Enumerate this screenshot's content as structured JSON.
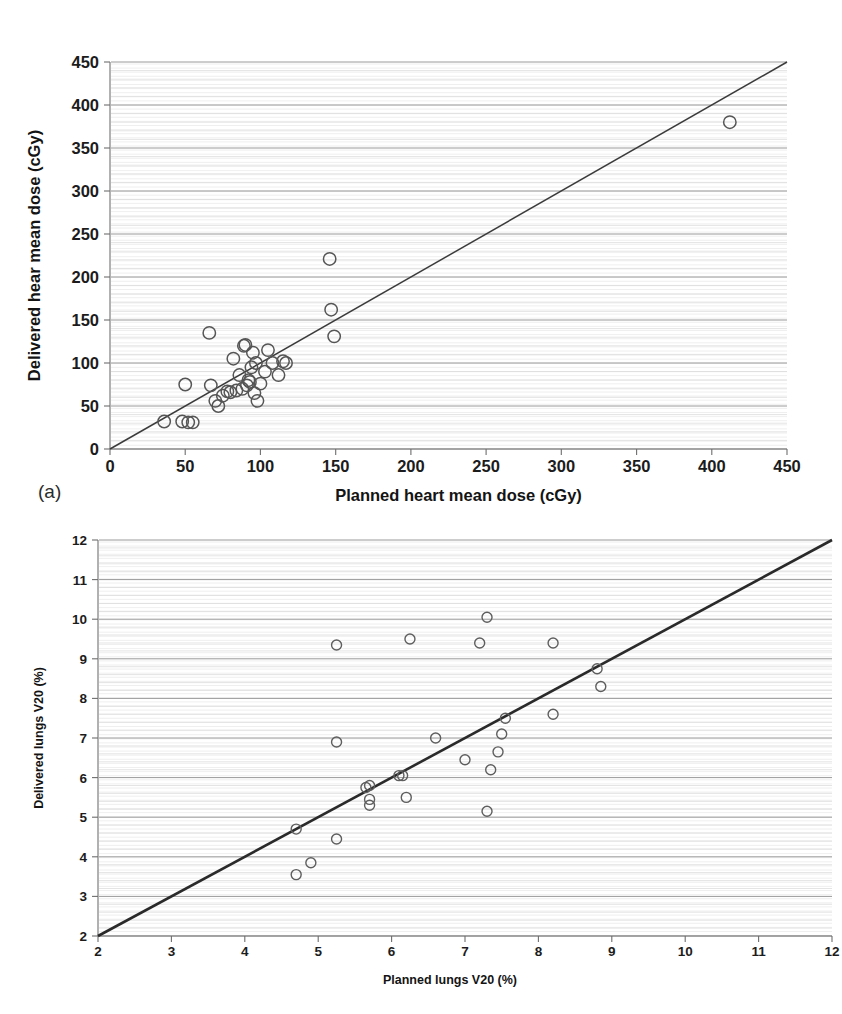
{
  "figure": {
    "panels": [
      {
        "id": "a",
        "label": "(a)"
      },
      {
        "id": "b",
        "label": "(b)"
      }
    ]
  },
  "chart_data": [
    {
      "type": "scatter",
      "panel": "(a)",
      "title": "",
      "xlabel": "Planned heart mean dose (cGy)",
      "ylabel": "Delivered hear mean dose (cGy)",
      "xlim": [
        0,
        450
      ],
      "ylim": [
        0,
        450
      ],
      "xticks": [
        0,
        50,
        100,
        150,
        200,
        250,
        300,
        350,
        400,
        450
      ],
      "yticks": [
        0,
        50,
        100,
        150,
        200,
        250,
        300,
        350,
        400,
        450
      ],
      "grid": true,
      "grid_axis": "y",
      "legend": "none",
      "marker": "open-circle",
      "reference_line": {
        "type": "identity",
        "from": [
          0,
          0
        ],
        "to": [
          450,
          450
        ],
        "label": "y = x"
      },
      "points": [
        [
          36,
          32
        ],
        [
          48,
          32
        ],
        [
          50,
          75
        ],
        [
          52,
          31
        ],
        [
          55,
          31
        ],
        [
          66,
          135
        ],
        [
          67,
          74
        ],
        [
          70,
          56
        ],
        [
          72,
          50
        ],
        [
          75,
          62
        ],
        [
          78,
          67
        ],
        [
          80,
          66
        ],
        [
          82,
          105
        ],
        [
          84,
          68
        ],
        [
          86,
          86
        ],
        [
          88,
          70
        ],
        [
          89,
          120
        ],
        [
          90,
          121
        ],
        [
          91,
          74
        ],
        [
          92,
          80
        ],
        [
          93,
          78
        ],
        [
          94,
          95
        ],
        [
          95,
          112
        ],
        [
          96,
          65
        ],
        [
          97,
          100
        ],
        [
          98,
          56
        ],
        [
          100,
          76
        ],
        [
          103,
          90
        ],
        [
          105,
          115
        ],
        [
          108,
          100
        ],
        [
          112,
          86
        ],
        [
          115,
          102
        ],
        [
          117,
          100
        ],
        [
          146,
          221
        ],
        [
          147,
          162
        ],
        [
          149,
          131
        ],
        [
          412,
          380
        ]
      ]
    },
    {
      "type": "scatter",
      "panel": "(b)",
      "title": "",
      "xlabel": "Planned lungs V20 (%)",
      "ylabel": "Delivered lungs V20 (%)",
      "xlim": [
        2,
        12
      ],
      "ylim": [
        2,
        12
      ],
      "xticks": [
        2,
        3,
        4,
        5,
        6,
        7,
        8,
        9,
        10,
        11,
        12
      ],
      "yticks": [
        2,
        3,
        4,
        5,
        6,
        7,
        8,
        9,
        10,
        11,
        12
      ],
      "grid": true,
      "grid_axis": "y",
      "legend": "none",
      "marker": "open-circle",
      "reference_line": {
        "type": "identity",
        "from": [
          2,
          2
        ],
        "to": [
          12,
          12
        ],
        "label": "y = x"
      },
      "points": [
        [
          4.7,
          3.55
        ],
        [
          4.9,
          3.85
        ],
        [
          4.7,
          4.7
        ],
        [
          5.25,
          4.45
        ],
        [
          5.25,
          6.9
        ],
        [
          5.25,
          9.35
        ],
        [
          5.65,
          5.75
        ],
        [
          5.7,
          5.8
        ],
        [
          5.7,
          5.45
        ],
        [
          5.7,
          5.3
        ],
        [
          6.1,
          6.05
        ],
        [
          6.15,
          6.05
        ],
        [
          6.2,
          5.5
        ],
        [
          6.25,
          9.5
        ],
        [
          6.6,
          7.0
        ],
        [
          7.0,
          6.45
        ],
        [
          7.2,
          9.4
        ],
        [
          7.3,
          10.05
        ],
        [
          7.3,
          5.15
        ],
        [
          7.35,
          6.2
        ],
        [
          7.45,
          6.65
        ],
        [
          7.5,
          7.1
        ],
        [
          7.55,
          7.5
        ],
        [
          8.2,
          9.4
        ],
        [
          8.2,
          7.6
        ],
        [
          8.8,
          8.75
        ],
        [
          8.85,
          8.3
        ]
      ]
    }
  ]
}
